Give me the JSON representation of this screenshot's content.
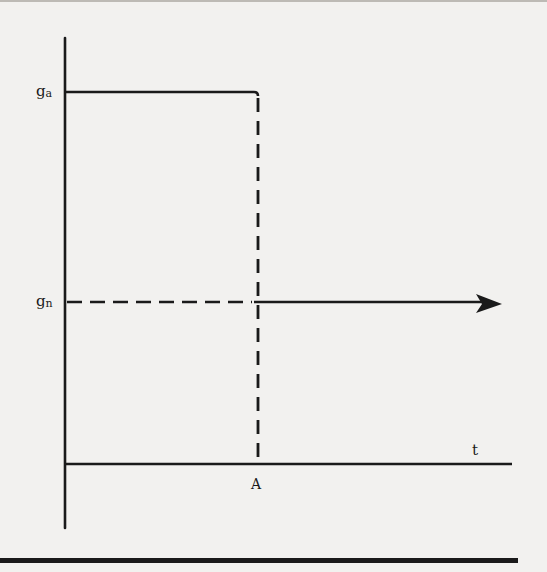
{
  "diagram": {
    "type": "step-function-plot",
    "colors": {
      "ink": "#1a1a1a",
      "paper": "#f2f1ef"
    },
    "y_axis": {
      "labels": [
        {
          "id": "ga",
          "base": "g",
          "sub": "a",
          "y": 92
        },
        {
          "id": "gn",
          "base": "g",
          "sub": "n",
          "y": 302
        }
      ]
    },
    "x_axis": {
      "label": "t",
      "marker_label": "A",
      "marker_x": 258
    },
    "series": [
      {
        "name": "g_a",
        "style": "solid",
        "from_x": 65,
        "to_x": 258,
        "y": 92
      },
      {
        "name": "g_a drop at A",
        "style": "dashed",
        "x": 258,
        "from_y": 92,
        "to_y": 464
      },
      {
        "name": "g_n before A",
        "style": "dashed",
        "from_x": 65,
        "to_x": 258,
        "y": 302
      },
      {
        "name": "g_n after A",
        "style": "solid-arrow",
        "from_x": 258,
        "to_x": 502,
        "y": 302
      }
    ]
  }
}
